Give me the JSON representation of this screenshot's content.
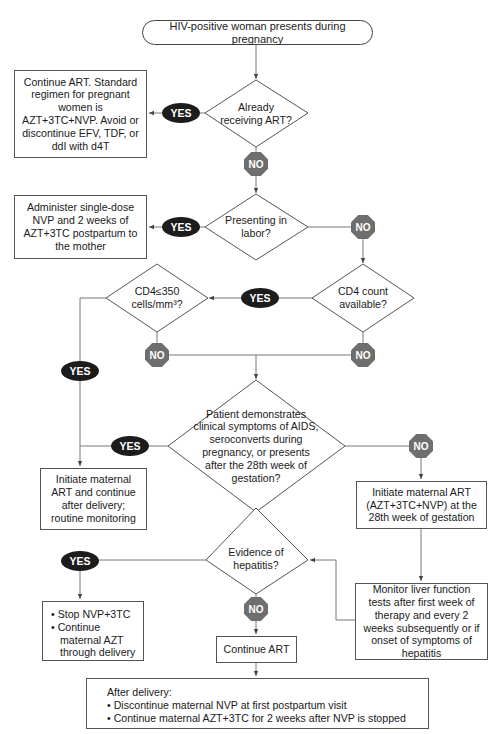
{
  "start": {
    "label": "HIV-positive woman presents during pregnancy"
  },
  "decisions": {
    "already_art": "Already receiving ART?",
    "in_labor": "Presenting in labor?",
    "cd4_available": "CD4 count available?",
    "cd4_350": "CD4≤350 cells/mm³?",
    "clinical": "Patient demonstrates clinical symptoms of AIDS, seroconverts during pregnancy, or presents after the 28th week of gestation?",
    "hepatitis": "Evidence of hepatitis?"
  },
  "actions": {
    "continue_art_standard": "Continue ART. Standard regimen for pregnant women is AZT+3TC+NVP. Avoid or discontinue EFV, TDF, or ddI with d4T",
    "labor_regimen": "Administer single-dose NVP and 2 weeks of AZT+3TC postpartum to the mother",
    "initiate_continue": "Initiate maternal ART and continue after delivery; routine monitoring",
    "initiate_28wk": "Initiate maternal ART (AZT+3TC+NVP) at the 28th week of gestation",
    "monitor_liver": "Monitor liver function tests after first week of therapy and every 2 weeks subsequently or if onset of symptoms of hepatitis",
    "stop_nvp": {
      "items": [
        "Stop NVP+3TC",
        "Continue maternal AZT through delivery"
      ]
    },
    "continue_art": "Continue ART",
    "after_delivery": {
      "heading": "After delivery:",
      "items": [
        "Discontinue maternal NVP at first postpartum visit",
        "Continue maternal AZT+3TC for 2 weeks after NVP is stopped"
      ]
    }
  },
  "labels": {
    "yes": "YES",
    "no": "NO"
  },
  "colors": {
    "yes_fill": "#1c1c1c",
    "no_fill": "#6e6e6e",
    "line": "#555555"
  }
}
